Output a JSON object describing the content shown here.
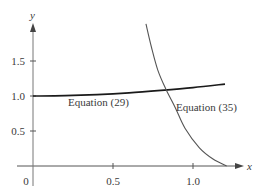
{
  "chart_data": {
    "type": "line",
    "title": "",
    "xlabel": "x",
    "ylabel": "y",
    "xlim": [
      -0.1,
      1.3
    ],
    "ylim": [
      0,
      2.05
    ],
    "grid": false,
    "legend": "none",
    "x_ticks": [
      0.5,
      1.0
    ],
    "x_tick_labels": [
      "0.5",
      "1.0"
    ],
    "y_ticks": [
      0.5,
      1.0,
      1.5
    ],
    "y_tick_labels": [
      "0.5",
      "1.0",
      "1.5"
    ],
    "origin_label": "0",
    "series": [
      {
        "name": "Equation (29)",
        "color": "#1a1a1a",
        "x": [
          0.0,
          0.2,
          0.4,
          0.6,
          0.8,
          1.0,
          1.2
        ],
        "y": [
          1.0,
          1.005,
          1.02,
          1.045,
          1.08,
          1.12,
          1.17
        ]
      },
      {
        "name": "Equation (35)",
        "color": "#555555",
        "x": [
          0.706,
          0.74,
          0.78,
          0.83,
          0.89,
          0.95,
          1.04,
          1.125,
          1.21
        ],
        "y": [
          2.03,
          1.7,
          1.37,
          1.1,
          0.83,
          0.54,
          0.26,
          0.1,
          0.0
        ]
      }
    ],
    "annotations": [
      {
        "text": "Equation (29)",
        "x": 0.22,
        "y": 0.9
      },
      {
        "text": "Equation (35)",
        "x": 0.89,
        "y": 0.84
      }
    ]
  },
  "labels": {
    "x_axis": "x",
    "y_axis": "y",
    "origin": "0",
    "xtick_05": "0.5",
    "xtick_10": "1.0",
    "ytick_05": "0.5",
    "ytick_10": "1.0",
    "ytick_15": "1.5",
    "eq29": "Equation (29)",
    "eq35": "Equation (35)"
  }
}
